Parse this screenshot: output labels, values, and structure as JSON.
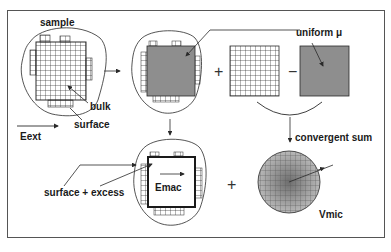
{
  "figure": {
    "labels": {
      "sample": "sample",
      "bulk": "bulk",
      "surface": "surface",
      "eext": "Eext",
      "uniform_mu": "uniform μ",
      "convergent_sum": "convergent sum",
      "surface_excess": "surface + excess",
      "emac": "Emac",
      "vmic": "Vmic"
    },
    "operators": {
      "plus_top": "+",
      "minus_top": "−",
      "plus_bottom": "+"
    },
    "colors": {
      "line": "#2a2a2a",
      "frame": "#555555",
      "fill_grey": "#8e8e8e",
      "background": "#ffffff"
    }
  }
}
